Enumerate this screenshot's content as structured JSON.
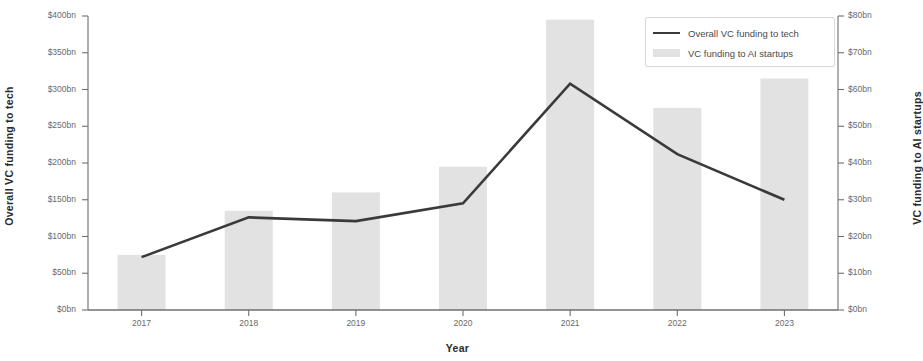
{
  "chart_data": {
    "type": "bar",
    "title": "",
    "xlabel": "Year",
    "categories": [
      "2017",
      "2018",
      "2019",
      "2020",
      "2021",
      "2022",
      "2023"
    ],
    "series": [
      {
        "name": "Overall VC funding to tech",
        "type": "line",
        "axis": "left",
        "unit": "bn",
        "values": [
          72,
          126,
          121,
          145,
          308,
          212,
          150
        ]
      },
      {
        "name": "VC funding to AI startups",
        "type": "bar",
        "axis": "right",
        "unit": "bn",
        "values": [
          15,
          27,
          32,
          39,
          79,
          55,
          63
        ]
      }
    ],
    "y_left": {
      "label": "Overall VC funding to tech",
      "ylim": [
        0,
        400
      ],
      "ticks": [
        0,
        50,
        100,
        150,
        200,
        250,
        300,
        350,
        400
      ],
      "tick_labels": [
        "$0bn",
        "$50bn",
        "$100bn",
        "$150bn",
        "$200bn",
        "$250bn",
        "$300bn",
        "$350bn",
        "$400bn"
      ]
    },
    "y_right": {
      "label": "VC funding to AI startups",
      "ylim": [
        0,
        80
      ],
      "ticks": [
        0,
        10,
        20,
        30,
        40,
        50,
        60,
        70,
        80
      ],
      "tick_labels": [
        "$0bn",
        "$10bn",
        "$20bn",
        "$30bn",
        "$40bn",
        "$50bn",
        "$60bn",
        "$70bn",
        "$80bn"
      ]
    },
    "grid": false,
    "legend": {
      "position": "top-right",
      "entries": [
        {
          "label": "Overall VC funding to tech",
          "marker": "line",
          "color": "#3a3a3a"
        },
        {
          "label": "VC funding to AI startups",
          "marker": "bar",
          "color": "#e2e2e2"
        }
      ]
    },
    "colors": {
      "line": "#3a3a3a",
      "bar": "#e2e2e2",
      "axis": "#6f6f6f",
      "text": "#4a4a4a",
      "background": "#ffffff"
    }
  }
}
